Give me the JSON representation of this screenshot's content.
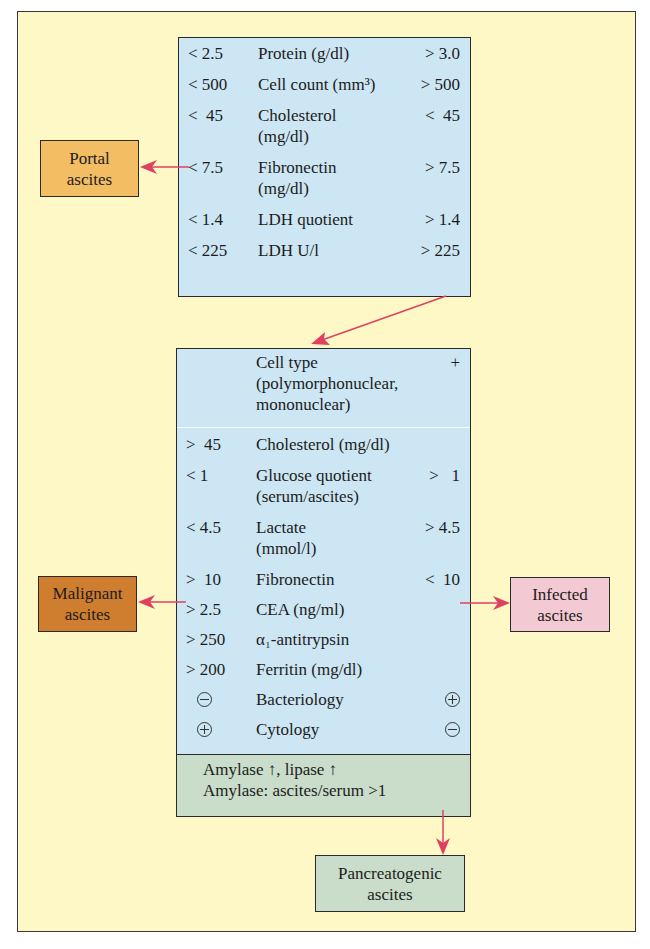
{
  "top_box": {
    "rows": [
      {
        "left": "< 2.5",
        "label": "Protein (g/dl)",
        "right": "> 3.0"
      },
      {
        "left": "< 500",
        "label": "Cell count (mm³)",
        "right": "> 500"
      },
      {
        "left": "<  45",
        "label": "Cholesterol",
        "label2": "(mg/dl)",
        "right": "<  45"
      },
      {
        "left": "< 7.5",
        "label": "Fibronectin",
        "label2": "(mg/dl)",
        "right": "> 7.5"
      },
      {
        "left": "< 1.4",
        "label": "LDH quotient",
        "right": "> 1.4"
      },
      {
        "left": "< 225",
        "label": "LDH U/l",
        "right": "> 225"
      }
    ]
  },
  "main_box": {
    "rows": [
      {
        "left": "",
        "label": "Cell type",
        "label2": "(polymorphonuclear,",
        "label3": "mononuclear)",
        "right": "+"
      },
      {
        "left": ">  45",
        "label": "Cholesterol (mg/dl)",
        "right": ""
      },
      {
        "left": "< 1",
        "label": "Glucose quotient",
        "label2": "(serum/ascites)",
        "right": ">   1"
      },
      {
        "left": "< 4.5",
        "label": "Lactate",
        "label2": "(mmol/l)",
        "right": "> 4.5"
      },
      {
        "left": ">  10",
        "label": "Fibronectin",
        "right": "<  10"
      },
      {
        "left": "> 2.5",
        "label": "CEA (ng/ml)",
        "right": ""
      },
      {
        "left": "> 250",
        "label": "α₁-antitrypsin",
        "right": ""
      },
      {
        "left": "> 200",
        "label": "Ferritin (mg/dl)",
        "right": ""
      },
      {
        "left_symbol": "minus-circle",
        "label": "Bacteriology",
        "right_symbol": "plus-circle"
      },
      {
        "left_symbol": "plus-circle",
        "label": "Cytology",
        "right_symbol": "minus-circle"
      }
    ],
    "pancreatic": {
      "line1": "Amylase ↑, lipase ↑",
      "line2": "Amylase: ascites/serum >1"
    }
  },
  "outcomes": {
    "portal": {
      "line1": "Portal",
      "line2": "ascites",
      "color": "#f2bd63"
    },
    "malignant": {
      "line1": "Malignant",
      "line2": "ascites",
      "color": "#cf7d2e"
    },
    "infected": {
      "line1": "Infected",
      "line2": "ascites",
      "color": "#f3c9d3"
    },
    "pancreatogenic": {
      "line1": "Pancreatogenic",
      "line2": "ascites",
      "color": "#c9ddca"
    }
  },
  "colors": {
    "background": "#fdf8c6",
    "table_fill": "#cde6f3",
    "arrow": "#e0405f"
  }
}
